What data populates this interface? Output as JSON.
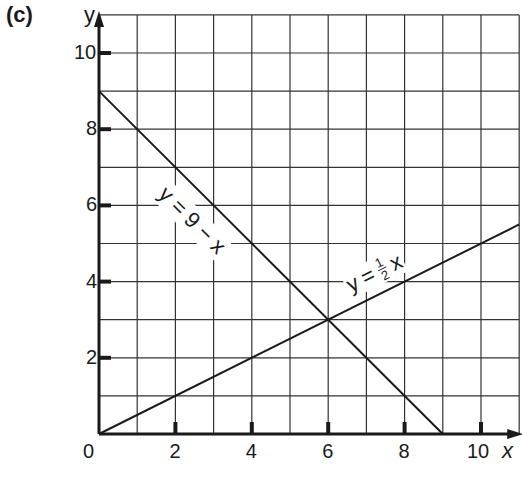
{
  "panel_label": "(c)",
  "chart_data": {
    "type": "line",
    "title": "",
    "xlabel": "x",
    "ylabel": "y",
    "xlim": [
      0,
      11
    ],
    "ylim": [
      0,
      11
    ],
    "grid": true,
    "grid_step": 1,
    "x_ticks": [
      0,
      2,
      4,
      6,
      8,
      10
    ],
    "y_ticks": [
      2,
      4,
      6,
      8,
      10
    ],
    "x_tick_labels": [
      "0",
      "2",
      "4",
      "6",
      "8",
      "10"
    ],
    "y_tick_labels": [
      "2",
      "4",
      "6",
      "8",
      "10"
    ],
    "series": [
      {
        "name": "y = 9 − x",
        "equation": "y = 9 - x",
        "x": [
          0,
          9
        ],
        "y": [
          9,
          0
        ]
      },
      {
        "name": "y = ½x",
        "equation": "y = 1/2 x",
        "x": [
          0,
          11
        ],
        "y": [
          0,
          5.5
        ]
      }
    ],
    "annotations": [
      {
        "text": "y = 9 − x",
        "near": [
          3.5,
          6.5
        ]
      },
      {
        "text": "y = ½ x",
        "near": [
          8,
          4.5
        ]
      }
    ],
    "intersection": {
      "x": 6,
      "y": 3
    },
    "legend": "none"
  },
  "labels": {
    "line1_y": "y",
    "line1_eq": "=",
    "line1_rhs": "9 − x",
    "line2_y": "y",
    "line2_eq": "=",
    "line2_num": "1",
    "line2_den": "2",
    "line2_x": "x"
  }
}
